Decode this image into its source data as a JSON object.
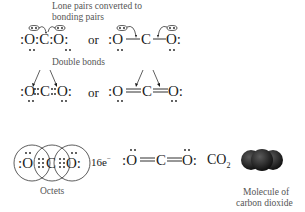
{
  "section1": {
    "caption_line1": "Lone pairs converted to",
    "caption_line2": "bonding pairs",
    "or_label": "or",
    "left_structure": {
      "atoms": [
        "O",
        "C",
        "O"
      ],
      "description": "Electron dot structure with lone pairs on oxygens circled and arrows showing conversion to bonding pairs"
    },
    "right_structure": {
      "atoms": [
        "O",
        "C",
        "O"
      ],
      "bonds": [
        "single",
        "single"
      ],
      "description": "Line structure with curved arrows from circled lone pairs on O toward O–C bonds"
    }
  },
  "section2": {
    "caption": "Double bonds",
    "or_label": "or",
    "left_structure": {
      "atoms": [
        "O",
        "C",
        "O"
      ],
      "description": "Electron dot structure with four shared dots between each O and C, arrows pointing to shared pairs"
    },
    "right_structure": {
      "atoms": [
        "O",
        "C",
        "O"
      ],
      "bonds": [
        "double",
        "double"
      ],
      "description": "Line structure O=C=O with arrows pointing to double bonds"
    }
  },
  "section3": {
    "octets_caption": "Octets",
    "electron_count": "16e",
    "electron_superscript": "−",
    "lewis_structure": {
      "atoms": [
        "O",
        "C",
        "O"
      ],
      "bonds": [
        "double",
        "double"
      ]
    },
    "formula_main": "CO",
    "formula_subscript": "2",
    "molecule_caption_line1": "Molecule of",
    "molecule_caption_line2": "carbon dioxide"
  },
  "colors": {
    "text": "#1a1a1a",
    "caption": "#555555",
    "molecule_dark": "#1c1c1c",
    "molecule_highlight": "#5a5a5a"
  }
}
